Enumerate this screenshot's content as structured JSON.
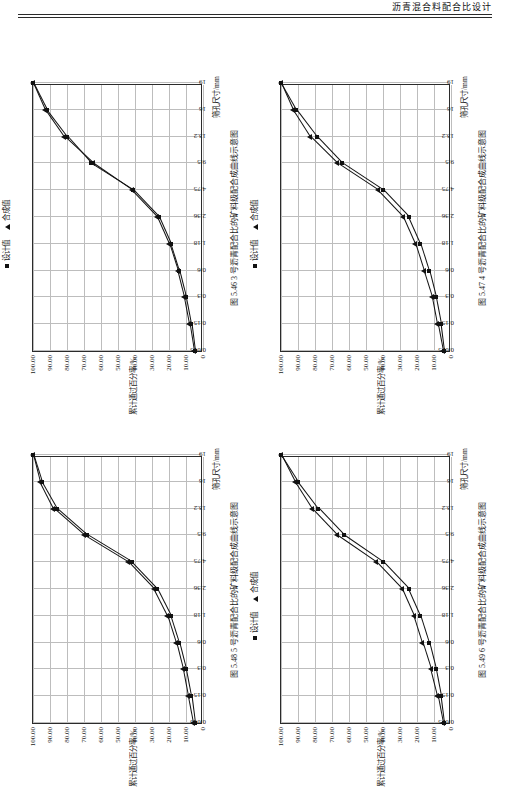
{
  "header": {
    "title": "沥青混合料配合比设计"
  },
  "axes": {
    "y_ticks": [
      "100.00",
      "90.00",
      "80.00",
      "70.00",
      "60.00",
      "50.00",
      "40.00",
      "30.00",
      "20.00",
      "10.00",
      "0"
    ],
    "y_values": [
      100,
      90,
      80,
      70,
      60,
      50,
      40,
      30,
      20,
      10,
      0
    ],
    "ylabel": "累计通过百分率/%",
    "xlabel": "筛孔尺寸/mm",
    "x_ticks": [
      "0.075",
      "0.15",
      "0.3",
      "0.6",
      "1.18",
      "2.36",
      "4.75",
      "9.5",
      "13.2",
      "16",
      "19"
    ],
    "x_values": [
      0.075,
      0.15,
      0.3,
      0.6,
      1.18,
      2.36,
      4.75,
      9.5,
      13.2,
      16,
      19
    ]
  },
  "legend": {
    "design": "设计值",
    "synthesis": "合成值"
  },
  "chart_data": [
    {
      "type": "line",
      "id": "fig-5-46",
      "title": "图 5.46  3 号沥青配合比的矿料级配合成曲线示意图",
      "xlabel": "筛孔尺寸/mm",
      "ylabel": "累计通过百分率/%",
      "x": [
        "0.075",
        "0.15",
        "0.3",
        "0.6",
        "1.18",
        "2.36",
        "4.75",
        "9.5",
        "13.2",
        "16",
        "19"
      ],
      "ylim": [
        0,
        100
      ],
      "grid": true,
      "legend_position": "top-right",
      "series": [
        {
          "name": "设计值",
          "marker": "square",
          "values": [
            5,
            7,
            10,
            14,
            19,
            26,
            41,
            66,
            80,
            92,
            100
          ]
        },
        {
          "name": "合成值",
          "marker": "triangle",
          "values": [
            5.5,
            8,
            11,
            15,
            20,
            27,
            42,
            65,
            82,
            93,
            100
          ]
        }
      ]
    },
    {
      "type": "line",
      "id": "fig-5-47",
      "title": "图 5.47  4 号沥青配合比的矿料级配合成曲线示意图",
      "xlabel": "筛孔尺寸/mm",
      "ylabel": "累计通过百分率/%",
      "x": [
        "0.075",
        "0.15",
        "0.3",
        "0.6",
        "1.18",
        "2.36",
        "4.75",
        "9.5",
        "13.2",
        "16",
        "19"
      ],
      "ylim": [
        0,
        100
      ],
      "grid": true,
      "legend_position": "top-right",
      "series": [
        {
          "name": "设计值",
          "marker": "square",
          "values": [
            4,
            6,
            9,
            13,
            18,
            25,
            40,
            64,
            79,
            91,
            100
          ]
        },
        {
          "name": "合成值",
          "marker": "triangle",
          "values": [
            5,
            8,
            11,
            16,
            21,
            28,
            43,
            67,
            83,
            93,
            100
          ]
        }
      ]
    },
    {
      "type": "line",
      "id": "fig-5-48",
      "title": "图 5.48  5 号沥青配合比的矿料级配合成曲线示意图",
      "xlabel": "筛孔尺寸/mm",
      "ylabel": "累计通过百分率/%",
      "x": [
        "0.075",
        "0.15",
        "0.3",
        "0.6",
        "1.18",
        "2.36",
        "4.75",
        "9.5",
        "13.2",
        "16",
        "19"
      ],
      "ylim": [
        0,
        100
      ],
      "grid": true,
      "legend_position": "none",
      "series": [
        {
          "name": "设计值",
          "marker": "square",
          "values": [
            5,
            7,
            10,
            14,
            19,
            27,
            42,
            68,
            86,
            95,
            100
          ]
        },
        {
          "name": "合成值",
          "marker": "triangle",
          "values": [
            6,
            9,
            12,
            16,
            21,
            29,
            44,
            70,
            88,
            96,
            100
          ]
        }
      ]
    },
    {
      "type": "line",
      "id": "fig-5-49",
      "title": "图 5.49  6 号沥青配合比的矿料级配合成曲线示意图",
      "xlabel": "筛孔尺寸/mm",
      "ylabel": "累计通过百分率/%",
      "x": [
        "0.075",
        "0.15",
        "0.3",
        "0.6",
        "1.18",
        "2.36",
        "4.75",
        "9.5",
        "13.2",
        "16",
        "19"
      ],
      "ylim": [
        0,
        100
      ],
      "grid": true,
      "legend_position": "top-right",
      "series": [
        {
          "name": "设计值",
          "marker": "square",
          "values": [
            4,
            6,
            9,
            13,
            18,
            25,
            40,
            63,
            78,
            90,
            100
          ]
        },
        {
          "name": "合成值",
          "marker": "triangle",
          "values": [
            5,
            8,
            12,
            17,
            22,
            29,
            44,
            67,
            82,
            92,
            100
          ]
        }
      ]
    }
  ]
}
